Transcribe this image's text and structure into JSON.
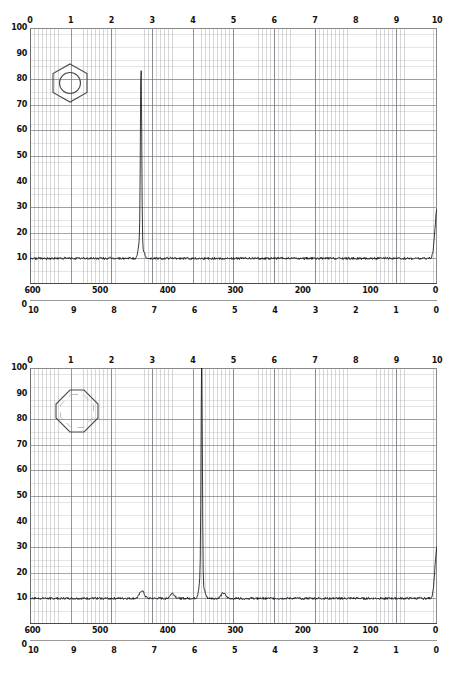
{
  "figure": {
    "title": "",
    "panels": [
      {
        "id": "panel-benzene",
        "molecule": "benzene-hexagon-icon",
        "molecule_label": "benzene",
        "axis_top": {
          "label": "",
          "ticks": [
            "0",
            "1",
            "2",
            "3",
            "4",
            "5",
            "6",
            "7",
            "8",
            "9",
            "10"
          ]
        },
        "axis_y": {
          "label": "",
          "ticks": [
            "100",
            "90",
            "80",
            "70",
            "60",
            "50",
            "40",
            "30",
            "20",
            "10",
            "0"
          ]
        },
        "axis_hz": {
          "label": "",
          "ticks": [
            "600",
            "500",
            "400",
            "300",
            "200",
            "100",
            "0"
          ]
        },
        "axis_ppm": {
          "label": "",
          "ticks": [
            "10",
            "9",
            "8",
            "7",
            "6",
            "5",
            "4",
            "3",
            "2",
            "1",
            "0"
          ]
        }
      },
      {
        "id": "panel-cyclooctatetraene",
        "molecule": "cyclooctatetraene-octagon-icon",
        "molecule_label": "cyclooctatetraene",
        "axis_top": {
          "label": "",
          "ticks": [
            "0",
            "1",
            "2",
            "3",
            "4",
            "5",
            "6",
            "7",
            "8",
            "9",
            "10"
          ]
        },
        "axis_y": {
          "label": "",
          "ticks": [
            "100",
            "90",
            "80",
            "70",
            "60",
            "50",
            "40",
            "30",
            "20",
            "10",
            "0"
          ]
        },
        "axis_hz": {
          "label": "",
          "ticks": [
            "600",
            "500",
            "400",
            "300",
            "200",
            "100",
            "0"
          ]
        },
        "axis_ppm": {
          "label": "",
          "ticks": [
            "10",
            "9",
            "8",
            "7",
            "6",
            "5",
            "4",
            "3",
            "2",
            "1",
            "0"
          ]
        }
      }
    ]
  },
  "chart_data": [
    {
      "type": "line",
      "title": "1H NMR spectrum of benzene",
      "xlabel": "ppm",
      "ylabel": "",
      "xlim": [
        10,
        0
      ],
      "ylim": [
        0,
        100
      ],
      "x_secondary": {
        "label": "Hz",
        "lim": [
          600,
          0
        ]
      },
      "x_tertiary": {
        "label": "",
        "lim": [
          0,
          10
        ]
      },
      "grid": true,
      "legend": "none",
      "baseline": 10,
      "peaks": [
        {
          "ppm": 7.27,
          "hz": 436,
          "height": 82,
          "label": "benzene aromatic H"
        },
        {
          "ppm": 7.27,
          "hz": 436,
          "height": 20,
          "label": "shoulder"
        },
        {
          "ppm": 0.0,
          "hz": 0,
          "height": 29,
          "label": "TMS reference"
        }
      ],
      "annotations": [
        "benzene ring structure inset at upper left"
      ]
    },
    {
      "type": "line",
      "title": "1H NMR spectrum of cyclooctatetraene",
      "xlabel": "ppm",
      "ylabel": "",
      "xlim": [
        10,
        0
      ],
      "ylim": [
        0,
        100
      ],
      "x_secondary": {
        "label": "Hz",
        "lim": [
          600,
          0
        ]
      },
      "x_tertiary": {
        "label": "",
        "lim": [
          0,
          10
        ]
      },
      "grid": true,
      "legend": "none",
      "baseline": 10,
      "peaks": [
        {
          "ppm": 5.78,
          "hz": 347,
          "height": 96,
          "label": "cyclooctatetraene vinyl H"
        },
        {
          "ppm": 5.78,
          "hz": 347,
          "height": 22,
          "label": "shoulder"
        },
        {
          "ppm": 7.25,
          "hz": 435,
          "height": 13,
          "label": "trace impurity"
        },
        {
          "ppm": 6.5,
          "hz": 390,
          "height": 12,
          "label": "trace impurity"
        },
        {
          "ppm": 5.25,
          "hz": 315,
          "height": 12,
          "label": "trace impurity"
        },
        {
          "ppm": 0.0,
          "hz": 0,
          "height": 30,
          "label": "TMS reference"
        }
      ],
      "annotations": [
        "cyclooctatetraene ring structure inset at upper left"
      ]
    }
  ]
}
